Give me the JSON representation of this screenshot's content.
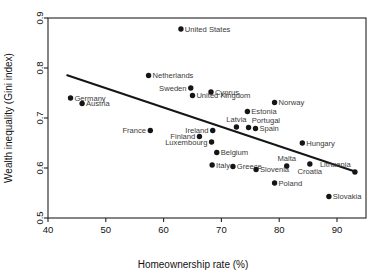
{
  "chart_data": {
    "type": "scatter",
    "title": "",
    "xlabel": "Homeownership rate (%)",
    "ylabel": "Wealth inequality (Gini index)",
    "xlim": [
      40,
      95
    ],
    "ylim": [
      0.5,
      0.9
    ],
    "xticks": [
      "40",
      "50",
      "60",
      "70",
      "80",
      "90"
    ],
    "xtick_values": [
      40,
      50,
      60,
      70,
      80,
      90
    ],
    "yticks": [
      "0.5",
      "0.6",
      "0.7",
      "0.8",
      "0.9"
    ],
    "ytick_values": [
      0.5,
      0.6,
      0.7,
      0.8,
      0.9
    ],
    "grid": false,
    "legend": "none",
    "marker_color": "#151515",
    "trendline_color": "#151515",
    "trendline": {
      "x_start": 43.2,
      "y_start": 0.786,
      "x_end": 93.1,
      "y_end": 0.593
    },
    "points": [
      {
        "label": "United States",
        "x": 63.0,
        "y": 0.878,
        "label_side": "right"
      },
      {
        "label": "Netherlands",
        "x": 57.4,
        "y": 0.785,
        "label_side": "right"
      },
      {
        "label": "Sweden",
        "x": 64.7,
        "y": 0.76,
        "label_side": "left"
      },
      {
        "label": "Cyprus",
        "x": 68.2,
        "y": 0.752,
        "label_side": "right"
      },
      {
        "label": "United Kingdom",
        "x": 65.0,
        "y": 0.745,
        "label_side": "right"
      },
      {
        "label": "Germany",
        "x": 43.9,
        "y": 0.74,
        "label_side": "right"
      },
      {
        "label": "Norway",
        "x": 79.2,
        "y": 0.731,
        "label_side": "right"
      },
      {
        "label": "Austria",
        "x": 45.9,
        "y": 0.729,
        "label_side": "right"
      },
      {
        "label": "Estonia",
        "x": 74.5,
        "y": 0.713,
        "label_side": "right"
      },
      {
        "label": "Latvia",
        "x": 72.6,
        "y": 0.682,
        "label_side": "above"
      },
      {
        "label": "Portugal",
        "x": 74.7,
        "y": 0.681,
        "label_side": "above-right"
      },
      {
        "label": "Spain",
        "x": 75.9,
        "y": 0.679,
        "label_side": "right"
      },
      {
        "label": "France",
        "x": 57.7,
        "y": 0.675,
        "label_side": "left"
      },
      {
        "label": "Ireland",
        "x": 68.5,
        "y": 0.675,
        "label_side": "left"
      },
      {
        "label": "Finland",
        "x": 66.2,
        "y": 0.663,
        "label_side": "left"
      },
      {
        "label": "Luxembourg",
        "x": 68.3,
        "y": 0.652,
        "label_side": "left"
      },
      {
        "label": "Hungary",
        "x": 84.0,
        "y": 0.65,
        "label_side": "right"
      },
      {
        "label": "Belgium",
        "x": 69.2,
        "y": 0.631,
        "label_side": "right"
      },
      {
        "label": "Italy",
        "x": 68.4,
        "y": 0.606,
        "label_side": "right"
      },
      {
        "label": "Croatia",
        "x": 85.3,
        "y": 0.608,
        "label_side": "below"
      },
      {
        "label": "Lithuania",
        "x": 93.1,
        "y": 0.592,
        "label_side": "above-left"
      },
      {
        "label": "Greece",
        "x": 72.0,
        "y": 0.603,
        "label_side": "right"
      },
      {
        "label": "Malta",
        "x": 81.3,
        "y": 0.604,
        "label_side": "above"
      },
      {
        "label": "Slovenia",
        "x": 76.0,
        "y": 0.597,
        "label_side": "right"
      },
      {
        "label": "Poland",
        "x": 79.2,
        "y": 0.57,
        "label_side": "right"
      },
      {
        "label": "Slovakia",
        "x": 88.6,
        "y": 0.543,
        "label_side": "right"
      }
    ]
  }
}
